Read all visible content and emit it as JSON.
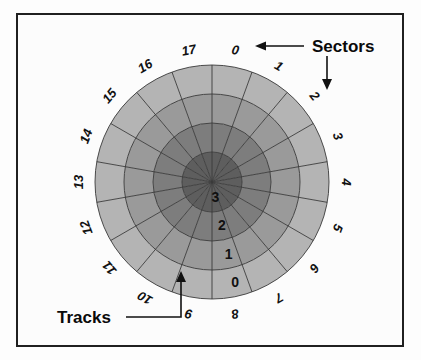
{
  "figure": {
    "background_color": "#fdfdfd",
    "frame_color": "#202020"
  },
  "chart_data": {
    "type": "pie",
    "subtype": "polar-sector-track-diagram",
    "center": {
      "x": 212,
      "y": 182
    },
    "outer_radius": 117,
    "sector_count": 18,
    "track_count": 4,
    "sector_start_angle_deg": 0,
    "sector_labels": [
      "0",
      "1",
      "2",
      "3",
      "4",
      "5",
      "6",
      "7",
      "8",
      "9",
      "10",
      "11",
      "12",
      "13",
      "14",
      "15",
      "16",
      "17"
    ],
    "track_labels": [
      "0",
      "1",
      "2",
      "3"
    ],
    "track_rings": [
      {
        "label": "0",
        "inner_radius": 88,
        "outer_radius": 117,
        "color": "#b4b4b4"
      },
      {
        "label": "1",
        "inner_radius": 59,
        "outer_radius": 88,
        "color": "#9a9a9a"
      },
      {
        "label": "2",
        "inner_radius": 30,
        "outer_radius": 59,
        "color": "#7d7d7d"
      },
      {
        "label": "3",
        "inner_radius": 0,
        "outer_radius": 30,
        "color": "#5e5e5e"
      }
    ],
    "grid": true,
    "legend": "none",
    "annotations": [
      {
        "name": "sectors",
        "text": "Sectors",
        "points_to": [
          "sector-0",
          "sector-2"
        ]
      },
      {
        "name": "tracks",
        "text": "Tracks",
        "points_to": [
          "track-number-column"
        ]
      }
    ]
  },
  "labels": {
    "sectors_callout": "Sectors",
    "tracks_callout": "Tracks"
  },
  "colors": {
    "ring_0": "#b4b4b4",
    "ring_1": "#9a9a9a",
    "ring_2": "#7d7d7d",
    "ring_3": "#5e5e5e",
    "grid_line": "#3a3a3a",
    "text": "#111111",
    "frame": "#202020"
  }
}
